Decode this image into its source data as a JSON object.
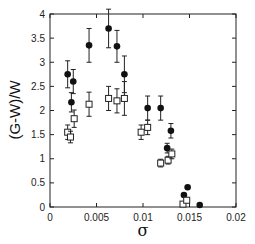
{
  "chart_data": {
    "type": "scatter",
    "title": "",
    "xlabel": "σ",
    "ylabel": "(G-W)/W",
    "xlim": [
      0,
      0.02
    ],
    "ylim": [
      0,
      4
    ],
    "xticks": [
      "0",
      "0.005",
      "0.01",
      "0.015",
      "0.02"
    ],
    "yticks": [
      "0",
      "0.5",
      "1",
      "1.5",
      "2",
      "2.5",
      "3",
      "3.5",
      "4"
    ],
    "grid": false,
    "legend": null,
    "series": [
      {
        "name": "filled circles",
        "marker": "filled-circle",
        "points": [
          {
            "x": 0.0019,
            "y": 2.75,
            "err": 0.28
          },
          {
            "x": 0.0025,
            "y": 2.6,
            "err": 0.25
          },
          {
            "x": 0.0023,
            "y": 2.17,
            "err": 0.2
          },
          {
            "x": 0.0042,
            "y": 3.35,
            "err": 0.35
          },
          {
            "x": 0.0063,
            "y": 3.7,
            "err": 0.4
          },
          {
            "x": 0.0072,
            "y": 3.33,
            "err": 0.33
          },
          {
            "x": 0.008,
            "y": 2.75,
            "err": 0.38
          },
          {
            "x": 0.0105,
            "y": 2.05,
            "err": 0.25
          },
          {
            "x": 0.0119,
            "y": 2.05,
            "err": 0.25
          },
          {
            "x": 0.013,
            "y": 1.58,
            "err": 0.15
          },
          {
            "x": 0.0126,
            "y": 1.22,
            "err": 0.1
          },
          {
            "x": 0.0148,
            "y": 0.41,
            "err": 0
          },
          {
            "x": 0.0144,
            "y": 0.25,
            "err": 0
          },
          {
            "x": 0.0161,
            "y": 0.04,
            "err": 0
          }
        ]
      },
      {
        "name": "open squares",
        "marker": "open-square",
        "points": [
          {
            "x": 0.0019,
            "y": 1.55,
            "err": 0.15
          },
          {
            "x": 0.0022,
            "y": 1.45,
            "err": 0.12
          },
          {
            "x": 0.0026,
            "y": 1.83,
            "err": 0.18
          },
          {
            "x": 0.0042,
            "y": 2.13,
            "err": 0.25
          },
          {
            "x": 0.0063,
            "y": 2.25,
            "err": 0.25
          },
          {
            "x": 0.0072,
            "y": 2.2,
            "err": 0.25
          },
          {
            "x": 0.008,
            "y": 2.25,
            "err": 0.35
          },
          {
            "x": 0.0098,
            "y": 1.55,
            "err": 0.15
          },
          {
            "x": 0.0105,
            "y": 1.65,
            "err": 0.15
          },
          {
            "x": 0.0119,
            "y": 0.91,
            "err": 0.08
          },
          {
            "x": 0.0127,
            "y": 0.97,
            "err": 0.08
          },
          {
            "x": 0.0131,
            "y": 1.1,
            "err": 0.1
          },
          {
            "x": 0.0143,
            "y": 0.06,
            "err": 0
          },
          {
            "x": 0.0147,
            "y": 0.14,
            "err": 0
          }
        ]
      }
    ]
  }
}
